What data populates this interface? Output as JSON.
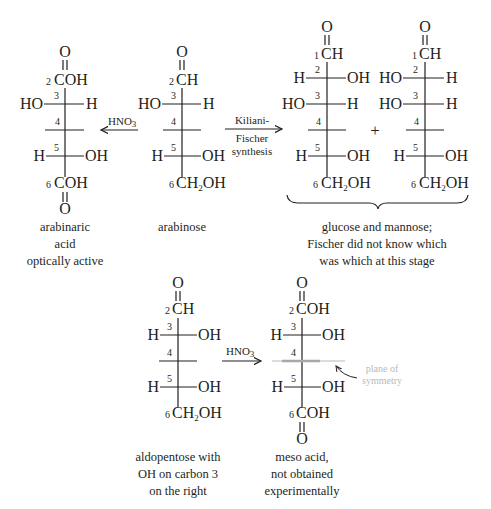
{
  "top_row": {
    "arabinaric_acid": {
      "top_O": "O",
      "c2": {
        "num": "2",
        "group": "COH"
      },
      "c3": {
        "num": "3",
        "left": "HO",
        "right": "H"
      },
      "c4": {
        "num": "4"
      },
      "c5": {
        "num": "5",
        "left": "H",
        "right": "OH"
      },
      "c6": {
        "num": "6",
        "group": "COH"
      },
      "bottom_O": "O",
      "caption": [
        "arabinaric",
        "acid",
        "optically active"
      ]
    },
    "arrow_hno3": {
      "reagent": "HNO",
      "subscript": "3"
    },
    "arabinose": {
      "top_O": "O",
      "c2": {
        "num": "2",
        "group": "CH"
      },
      "c3": {
        "num": "3",
        "left": "HO",
        "right": "H"
      },
      "c4": {
        "num": "4"
      },
      "c5": {
        "num": "5",
        "left": "H",
        "right": "OH"
      },
      "c6": {
        "num": "6",
        "group_pre": "CH",
        "group_sub": "2",
        "group_post": "OH"
      },
      "caption": [
        "arabinose"
      ]
    },
    "arrow_kiliani": {
      "label_above": "Kiliani-",
      "label_below": [
        "Fischer",
        "synthesis"
      ]
    },
    "glucose": {
      "top_O": "O",
      "c1": {
        "num": "1",
        "group": "CH"
      },
      "c2": {
        "num": "2",
        "left": "H",
        "right": "OH"
      },
      "c3": {
        "num": "3",
        "left": "HO",
        "right": "H"
      },
      "c4": {
        "num": "4"
      },
      "c5": {
        "num": "5",
        "left": "H",
        "right": "OH"
      },
      "c6": {
        "num": "6",
        "group_pre": "CH",
        "group_sub": "2",
        "group_post": "OH"
      }
    },
    "plus": "+",
    "mannose": {
      "top_O": "O",
      "c1": {
        "num": "1",
        "group": "CH"
      },
      "c2": {
        "num": "2",
        "left": "HO",
        "right": "H"
      },
      "c3": {
        "num": "3",
        "left": "HO",
        "right": "H"
      },
      "c4": {
        "num": "4"
      },
      "c5": {
        "num": "5",
        "left": "H",
        "right": "OH"
      },
      "c6": {
        "num": "6",
        "group_pre": "CH",
        "group_sub": "2",
        "group_post": "OH"
      }
    },
    "pair_caption": [
      "glucose and mannose;",
      "Fischer did not know which",
      "was which at this stage"
    ]
  },
  "bottom_row": {
    "aldopentose": {
      "top_O": "O",
      "c2": {
        "num": "2",
        "group": "CH"
      },
      "c3": {
        "num": "3",
        "left": "H",
        "right": "OH"
      },
      "c4": {
        "num": "4"
      },
      "c5": {
        "num": "5",
        "left": "H",
        "right": "OH"
      },
      "c6": {
        "num": "6",
        "group_pre": "CH",
        "group_sub": "2",
        "group_post": "OH"
      },
      "caption": [
        "aldopentose with",
        "OH on carbon 3",
        "on the right"
      ]
    },
    "arrow_hno3": {
      "reagent": "HNO",
      "subscript": "3"
    },
    "meso_acid": {
      "top_O": "O",
      "c2": {
        "num": "2",
        "group": "COH"
      },
      "c3": {
        "num": "3",
        "left": "H",
        "right": "OH"
      },
      "c4": {
        "num": "4"
      },
      "c5": {
        "num": "5",
        "left": "H",
        "right": "OH"
      },
      "c6": {
        "num": "6",
        "group": "COH"
      },
      "bottom_O": "O",
      "symmetry_label": [
        "plane of",
        "symmetry"
      ],
      "caption": [
        "meso acid,",
        "not obtained",
        "experimentally"
      ]
    }
  },
  "colors": {
    "ink": "#231f20",
    "symmetry_plane": "#a8a8a8",
    "symmetry_label": "#b9b9b9"
  }
}
